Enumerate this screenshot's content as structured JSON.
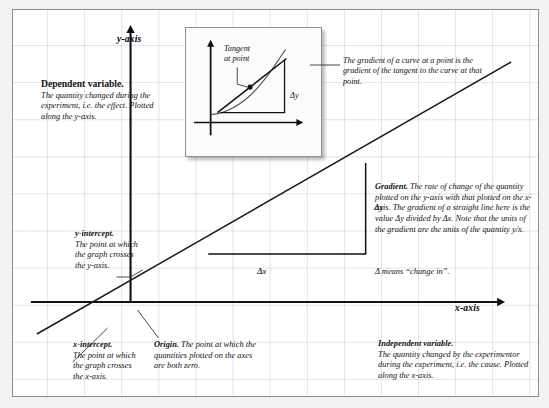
{
  "diagram": {
    "axis_labels": {
      "y": "y-axis",
      "x": "x-axis"
    },
    "main_graph": {
      "delta_y": "Δy",
      "delta_x": "Δx"
    },
    "inset": {
      "tangent_label_line1": "Tangent",
      "tangent_label_line2": "at point",
      "delta_y": "Δy",
      "caption": "The gradient of a curve at a point is the gradient of the tangent to the curve at that point."
    },
    "notes": {
      "dependent": {
        "heading": "Dependent variable.",
        "body": "The quantity changed during the experiment, i.e. the effect. Plotted along the y-axis."
      },
      "y_intercept": {
        "heading": "y-intercept.",
        "body": "The point at which the graph crosses the y-axis."
      },
      "x_intercept": {
        "heading": "x-intercept.",
        "body": "The point at which the graph crosses the x-axis."
      },
      "origin": {
        "heading": "Origin.",
        "body": "The point at which the quantities plotted on the axes are both zero."
      },
      "gradient": {
        "heading": "Gradient.",
        "body": "The rate of change of the quantity plotted on the y-axis with that plotted on the x-axis. The gradient of a straight line here is the value Δy divided by Δx. Note that the units of the gradient are the units of the quantity y/x."
      },
      "delta_means": {
        "body": "Δ means “change in”."
      },
      "independent": {
        "heading": "Independent variable.",
        "body": "The quantity changed by the experimentor during the experiment, i.e. the cause. Plotted along the x-axis."
      }
    },
    "colors": {
      "page_background": "#f2f2f2",
      "board_background": "#ffffff",
      "border": "#8d8d8d",
      "grid_line": "#a0a0af",
      "ink": "#111111"
    }
  }
}
